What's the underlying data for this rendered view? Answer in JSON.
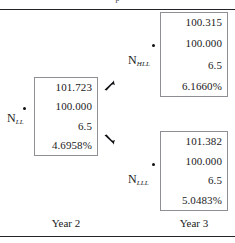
{
  "figure": {
    "clipped_header_text": "p",
    "background_color": "#ffffff",
    "rule_color": "#23232a",
    "box_border_color": "#8e8e95",
    "text_color": "#1a1a1a"
  },
  "nodes": {
    "ll": {
      "label_base": "N",
      "label_sub": "LL",
      "values": [
        "101.723",
        "100.000",
        "6.5",
        "4.6958%"
      ]
    },
    "hll": {
      "label_base": "N",
      "label_sub": "HLL",
      "values": [
        "100.315",
        "100.000",
        "6.5",
        "6.1660%"
      ]
    },
    "lll": {
      "label_base": "N",
      "label_sub": "LLL",
      "values": [
        "101.382",
        "100.000",
        "6.5",
        "5.0483%"
      ]
    }
  },
  "axis_captions": {
    "year_2": "Year 2",
    "year_3": "Year 3"
  },
  "arrows": {
    "up_right": "arrow-up-right",
    "down_right": "arrow-down-right"
  }
}
